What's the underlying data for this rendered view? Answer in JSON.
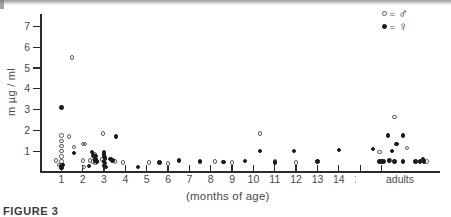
{
  "legend": {
    "position": "top-right",
    "entries": [
      {
        "marker": "open-circle",
        "equals": "=",
        "symbol": "♂",
        "meaning": "male"
      },
      {
        "marker": "filled-circle",
        "equals": "=",
        "symbol": "♀",
        "meaning": "female"
      }
    ]
  },
  "caption": {
    "text": "FIGURE 3"
  },
  "adults": {
    "label": "adults"
  },
  "colors": {
    "axis": "#2b2b2b",
    "text": "#4a4a4a",
    "male_marker": "#5c5c5c",
    "female_marker": "#1c1c1c"
  },
  "chart_data": {
    "type": "scatter",
    "title": "",
    "xlabel": "(months of age)",
    "ylabel": "m µg / ml",
    "xlim": [
      0,
      18.6
    ],
    "ylim": [
      0,
      7.6
    ],
    "xticks": [
      1,
      2,
      3,
      4,
      5,
      6,
      7,
      8,
      9,
      10,
      11,
      12,
      13,
      14,
      15,
      16
    ],
    "xtick_labels": [
      "1",
      "2",
      "3",
      "4",
      "5",
      "6",
      "7",
      "8",
      "9",
      "10",
      "11",
      "12",
      "13",
      "14",
      "15",
      "16"
    ],
    "yticks": [
      1,
      2,
      3,
      4,
      5,
      6,
      7
    ],
    "ytick_labels": [
      "1",
      "2",
      "3",
      "4",
      "5",
      "6",
      "7"
    ],
    "grid": false,
    "annotations": [
      {
        "text": "adults",
        "x_start": 16.2,
        "x_end": 18.5,
        "style": "double-headed-arrow"
      }
    ],
    "series": [
      {
        "name": "♂",
        "marker": "open-circle",
        "points": [
          [
            0.75,
            0.55
          ],
          [
            0.9,
            0.35
          ],
          [
            1.0,
            1.75
          ],
          [
            1.0,
            1.5
          ],
          [
            1.0,
            1.25
          ],
          [
            1.0,
            1.0
          ],
          [
            1.0,
            0.75
          ],
          [
            1.0,
            0.5
          ],
          [
            1.0,
            0.3
          ],
          [
            1.5,
            5.5
          ],
          [
            1.35,
            1.7
          ],
          [
            1.6,
            1.2
          ],
          [
            2.0,
            1.35
          ],
          [
            2.1,
            1.35
          ],
          [
            2.0,
            0.55
          ],
          [
            2.05,
            0.25
          ],
          [
            2.35,
            0.55
          ],
          [
            2.5,
            0.5
          ],
          [
            2.55,
            0.85
          ],
          [
            2.6,
            0.45
          ],
          [
            2.95,
            1.85
          ],
          [
            2.9,
            0.6
          ],
          [
            3.0,
            0.35
          ],
          [
            3.05,
            0.3
          ],
          [
            3.5,
            0.5
          ],
          [
            3.9,
            0.45
          ],
          [
            5.1,
            0.45
          ],
          [
            6.0,
            0.4
          ],
          [
            8.2,
            0.5
          ],
          [
            9.0,
            0.45
          ],
          [
            10.3,
            1.85
          ],
          [
            11.0,
            0.5
          ],
          [
            12.0,
            0.45
          ],
          [
            15.9,
            0.95
          ],
          [
            16.6,
            2.65
          ],
          [
            17.2,
            1.15
          ],
          [
            16.4,
            0.55
          ],
          [
            18.1,
            0.5
          ]
        ]
      },
      {
        "name": "♀",
        "marker": "filled-circle",
        "points": [
          [
            1.0,
            3.1
          ],
          [
            1.0,
            0.28
          ],
          [
            1.0,
            0.2
          ],
          [
            1.05,
            0.35
          ],
          [
            1.6,
            0.9
          ],
          [
            2.45,
            0.95
          ],
          [
            2.5,
            0.8
          ],
          [
            2.55,
            0.72
          ],
          [
            2.6,
            0.78
          ],
          [
            2.62,
            0.62
          ],
          [
            2.58,
            0.55
          ],
          [
            2.68,
            0.5
          ],
          [
            2.3,
            0.28
          ],
          [
            3.0,
            0.95
          ],
          [
            3.0,
            0.85
          ],
          [
            3.02,
            0.72
          ],
          [
            3.05,
            0.62
          ],
          [
            3.0,
            0.5
          ],
          [
            3.05,
            0.42
          ],
          [
            3.0,
            0.3
          ],
          [
            3.08,
            0.25
          ],
          [
            3.3,
            0.62
          ],
          [
            3.4,
            0.55
          ],
          [
            3.55,
            1.7
          ],
          [
            4.6,
            0.25
          ],
          [
            5.6,
            0.45
          ],
          [
            6.5,
            0.55
          ],
          [
            7.5,
            0.5
          ],
          [
            8.6,
            0.48
          ],
          [
            9.6,
            0.52
          ],
          [
            10.3,
            1.0
          ],
          [
            11.0,
            0.45
          ],
          [
            11.9,
            1.0
          ],
          [
            13.0,
            0.5
          ],
          [
            14.0,
            1.05
          ],
          [
            16.0,
            0.5
          ],
          [
            16.3,
            1.75
          ],
          [
            17.0,
            1.75
          ],
          [
            16.7,
            1.35
          ],
          [
            16.5,
            1.0
          ],
          [
            15.6,
            1.1
          ],
          [
            15.9,
            0.5
          ],
          [
            16.1,
            0.5
          ],
          [
            16.35,
            0.55
          ],
          [
            16.6,
            0.5
          ],
          [
            17.0,
            0.5
          ],
          [
            17.6,
            0.5
          ],
          [
            17.8,
            0.5
          ],
          [
            18.0,
            0.5
          ],
          [
            17.95,
            0.62
          ]
        ]
      }
    ]
  }
}
